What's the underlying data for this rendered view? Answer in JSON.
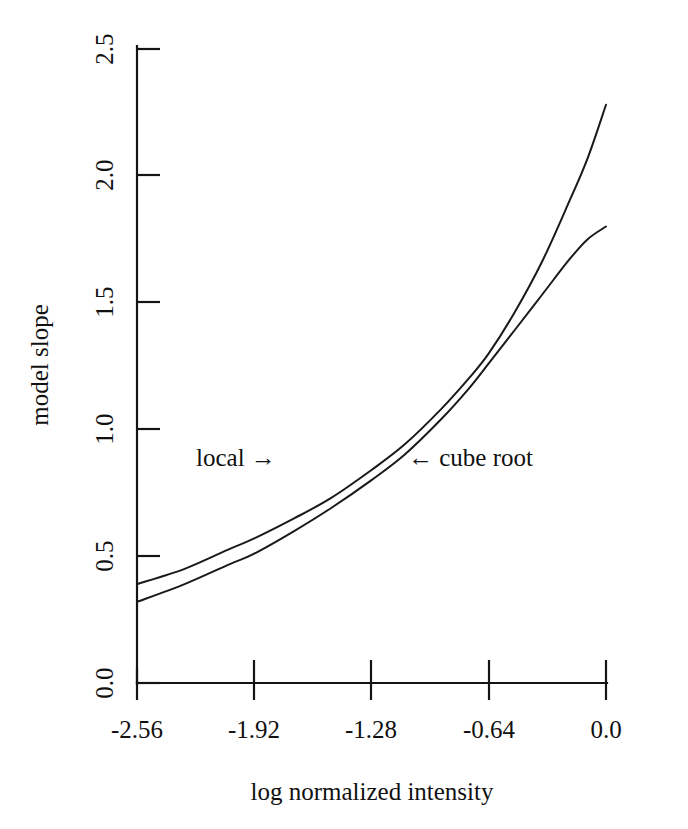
{
  "chart_data": {
    "type": "line",
    "title": "",
    "xlabel": "log normalized intensity",
    "ylabel": "model slope",
    "xlim": [
      -2.56,
      0.0
    ],
    "ylim": [
      0.0,
      2.5
    ],
    "grid": false,
    "legend": "none",
    "xticks": [
      "-2.56",
      "-1.92",
      "-1.28",
      "-0.64",
      "0.0"
    ],
    "xtick_values": [
      -2.56,
      -1.92,
      -1.28,
      -0.64,
      0.0
    ],
    "yticks": [
      "0.0",
      "0.5",
      "1.0",
      "1.5",
      "2.0",
      "2.5"
    ],
    "ytick_values": [
      0.0,
      0.5,
      1.0,
      1.5,
      2.0,
      2.5
    ],
    "series": [
      {
        "name": "cube root",
        "x": [
          -2.56,
          -2.3,
          -2.05,
          -1.92,
          -1.7,
          -1.5,
          -1.28,
          -1.1,
          -0.9,
          -0.75,
          -0.64,
          -0.5,
          -0.35,
          -0.2,
          -0.1,
          0.0
        ],
        "values": [
          0.39,
          0.45,
          0.53,
          0.57,
          0.65,
          0.73,
          0.84,
          0.94,
          1.08,
          1.2,
          1.3,
          1.46,
          1.66,
          1.9,
          2.07,
          2.28
        ]
      },
      {
        "name": "local",
        "x": [
          -2.56,
          -2.3,
          -2.05,
          -1.92,
          -1.7,
          -1.5,
          -1.28,
          -1.1,
          -0.9,
          -0.75,
          -0.64,
          -0.5,
          -0.35,
          -0.2,
          -0.1,
          0.0
        ],
        "values": [
          0.32,
          0.39,
          0.47,
          0.51,
          0.6,
          0.69,
          0.8,
          0.9,
          1.04,
          1.16,
          1.26,
          1.39,
          1.53,
          1.67,
          1.75,
          1.8
        ]
      }
    ],
    "annotations": [
      {
        "text": "local  →",
        "x": -1.7,
        "y": 0.88
      },
      {
        "text": "←  cube root",
        "x": -1.05,
        "y": 0.88
      }
    ]
  },
  "axis": {
    "y_title": "model slope",
    "x_title": "log normalized intensity"
  },
  "annotations": {
    "local_label": "local  →",
    "cube_root_label": "←  cube root"
  },
  "xticks": {
    "t0": "-2.56",
    "t1": "-1.92",
    "t2": "-1.28",
    "t3": "-0.64",
    "t4": "0.0"
  },
  "yticks": {
    "t0": "0.0",
    "t1": "0.5",
    "t2": "1.0",
    "t3": "1.5",
    "t4": "2.0",
    "t5": "2.5"
  }
}
